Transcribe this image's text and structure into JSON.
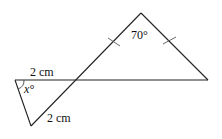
{
  "diagram": {
    "type": "geometry",
    "large_triangle": {
      "apex_angle_label": "70°",
      "equal_side_marks": 2
    },
    "small_triangle": {
      "angle_label": "x°",
      "top_side_label": "2 cm",
      "bottom_side_label": "2 cm"
    }
  }
}
